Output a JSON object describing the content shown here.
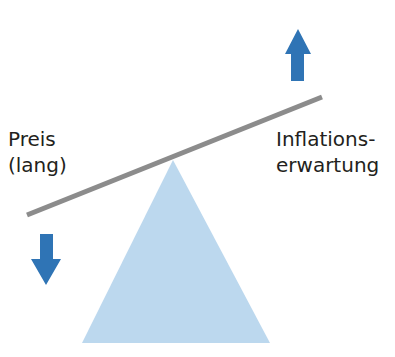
{
  "diagram": {
    "type": "seesaw",
    "left_label_line1": "Preis",
    "left_label_line2": "(lang)",
    "right_label_line1": "Inflations-",
    "right_label_line2": "erwartung",
    "left_arrow": "down",
    "right_arrow": "up",
    "colors": {
      "arrow": "#2f74b5",
      "fulcrum": "#bcd8ee",
      "beam": "#8c8c8c",
      "text": "#231f20"
    }
  }
}
